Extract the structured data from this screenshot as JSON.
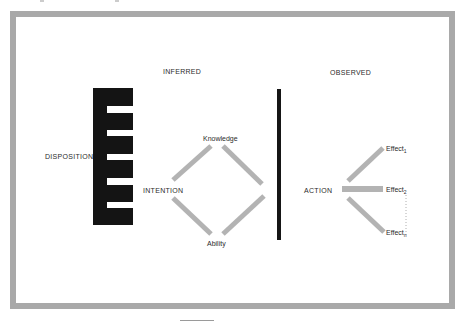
{
  "figure": {
    "sections": {
      "inferred": "INFERRED",
      "observed": "OBSERVED"
    },
    "nodes": {
      "disposition": "DISPOSITION",
      "intention": "INTENTION",
      "knowledge": "Knowledge",
      "ability": "Ability",
      "action": "ACTION"
    },
    "effects": [
      {
        "label": "Effect",
        "subscript": "1"
      },
      {
        "label": "Effect",
        "subscript": "2"
      },
      {
        "label": "Effect",
        "subscript": "n"
      }
    ],
    "colors": {
      "frame": "#a9a9a9",
      "connector": "#b3b3b3",
      "block": "#141414",
      "divider": "#161616",
      "text": "#2b2b2b"
    }
  }
}
